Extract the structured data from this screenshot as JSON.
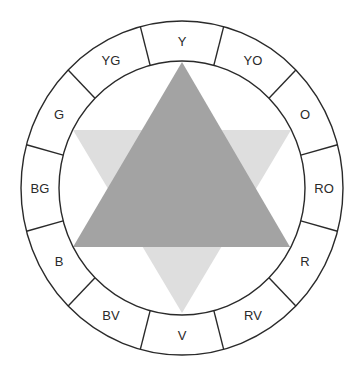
{
  "diagram": {
    "center": [
      182,
      188
    ],
    "outer_radius": [
      161,
      167
    ],
    "inner_radius": [
      123,
      127
    ],
    "segments": [
      {
        "label": "Y",
        "angle": 0
      },
      {
        "label": "YO",
        "angle": 30
      },
      {
        "label": "O",
        "angle": 60
      },
      {
        "label": "RO",
        "angle": 90
      },
      {
        "label": "R",
        "angle": 120
      },
      {
        "label": "RV",
        "angle": 150
      },
      {
        "label": "V",
        "angle": 180
      },
      {
        "label": "BV",
        "angle": 210
      },
      {
        "label": "B",
        "angle": 240
      },
      {
        "label": "BG",
        "angle": 270
      },
      {
        "label": "G",
        "angle": 300
      },
      {
        "label": "YG",
        "angle": 330
      }
    ],
    "triangles": [
      {
        "name": "down-triangle",
        "points": "73,130 291,130 182,313",
        "color": "#dedede"
      },
      {
        "name": "up-triangle",
        "points": "182,62 290,247 73,247",
        "color": "#a3a3a3"
      }
    ],
    "colors": {
      "stroke": "#2a2a2a",
      "background": "#ffffff"
    }
  }
}
